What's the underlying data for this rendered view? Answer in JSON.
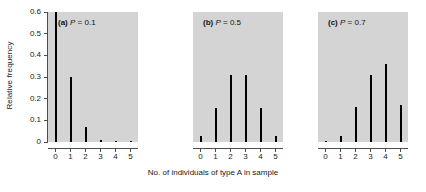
{
  "chart_data": {
    "type": "bar",
    "title": "",
    "xlabel": "No. of individuals of type A in sample",
    "ylabel": "Relative frequency",
    "ylim": [
      0,
      0.6
    ],
    "xlim": [
      0,
      5
    ],
    "grid": false,
    "legend": null,
    "y_ticks": [
      "0",
      "0.1",
      "0.2",
      "0.3",
      "0.4",
      "0.5",
      "0.6"
    ],
    "y_tick_values": [
      0,
      0.1,
      0.2,
      0.3,
      0.4,
      0.5,
      0.6
    ],
    "x_ticks": [
      "0",
      "1",
      "2",
      "3",
      "4",
      "5"
    ],
    "categories": [
      0,
      1,
      2,
      3,
      4,
      5
    ],
    "panels": [
      {
        "key": "a",
        "letter": "(a)",
        "param_symbol": "P",
        "param_value": "0.1",
        "title": "(a) P = 0.1",
        "values": [
          0.6,
          0.3,
          0.07,
          0.01,
          0.005,
          0.002
        ]
      },
      {
        "key": "b",
        "letter": "(b)",
        "param_symbol": "P",
        "param_value": "0.5",
        "title": "(b) P = 0.5",
        "values": [
          0.03,
          0.155,
          0.31,
          0.31,
          0.155,
          0.03
        ]
      },
      {
        "key": "c",
        "letter": "(c)",
        "param_symbol": "P",
        "param_value": "0.7",
        "title": "(c) P = 0.7",
        "values": [
          0.005,
          0.03,
          0.16,
          0.31,
          0.36,
          0.17
        ]
      }
    ]
  }
}
